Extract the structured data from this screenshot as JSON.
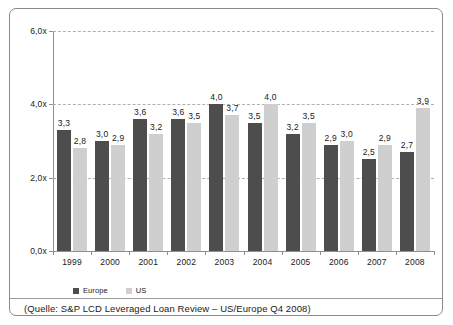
{
  "chart_data": {
    "type": "bar",
    "title": "",
    "xlabel": "",
    "ylabel": "",
    "categories": [
      "1999",
      "2000",
      "2001",
      "2002",
      "2003",
      "2004",
      "2005",
      "2006",
      "2007",
      "2008"
    ],
    "series": [
      {
        "name": "Europe",
        "color": "#4d4d4d",
        "values": [
          3.3,
          3.0,
          3.6,
          3.6,
          4.0,
          3.5,
          3.2,
          2.9,
          2.5,
          2.7
        ],
        "labels": [
          "3,3",
          "3,0",
          "3,6",
          "3,6",
          "4,0",
          "3,5",
          "3,2",
          "2,9",
          "2,5",
          "2,7"
        ]
      },
      {
        "name": "US",
        "color": "#cfcfcf",
        "values": [
          2.8,
          2.9,
          3.2,
          3.5,
          3.7,
          4.0,
          3.5,
          3.0,
          2.9,
          3.9
        ],
        "labels": [
          "2,8",
          "2,9",
          "3,2",
          "3,5",
          "3,7",
          "4,0",
          "3,5",
          "3,0",
          "2,9",
          "3,9"
        ]
      }
    ],
    "ylim": [
      0,
      6
    ],
    "yticks": [
      0,
      2,
      4,
      6
    ],
    "ytick_labels": [
      "0,0x",
      "2,0x",
      "4,0x",
      "6,0x"
    ],
    "grid": true,
    "grid_style": "dashed",
    "legend_position": "bottom-left"
  },
  "legend": {
    "items": [
      {
        "label": "Europe",
        "swatch": "europe"
      },
      {
        "label": "US",
        "swatch": "us"
      }
    ]
  },
  "caption": {
    "text": "(Quelle: S&P LCD Leveraged Loan Review – US/Europe Q4 2008)"
  }
}
